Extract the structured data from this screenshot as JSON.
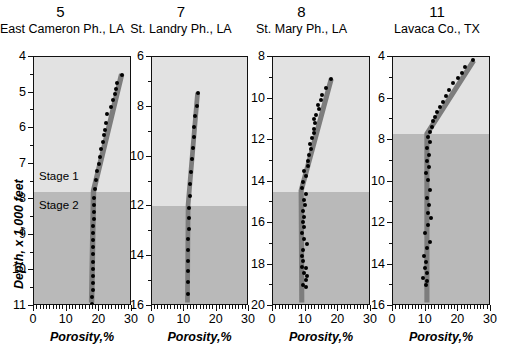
{
  "figure": {
    "yaxis_title": "Depth, x 1,000 feet",
    "xaxis_title": "Porosity,%",
    "stage_labels": {
      "stage1": "Stage 1",
      "stage2": "Stage 2"
    },
    "colors": {
      "stage1_fill": "#e2e2e2",
      "stage2_fill": "#b9b9b9",
      "trend_band": "#7d7d7d",
      "point": "#000000",
      "axis": "#111111"
    }
  },
  "chart_data": [
    {
      "type": "scatter",
      "panel_number": "5",
      "title": "East Cameron Ph., LA",
      "xlabel": "Porosity,%",
      "ylabel": "Depth, x 1,000 feet",
      "xlim": [
        0,
        30
      ],
      "ylim": [
        4,
        11
      ],
      "xticks": [
        0,
        10,
        20,
        30
      ],
      "yticks": [
        4,
        5,
        6,
        7,
        8,
        9,
        10,
        11
      ],
      "y_inverted": true,
      "grid": false,
      "stage_boundary_depth": 7.8,
      "stage1_label": "Stage 1",
      "stage2_label": "Stage 2",
      "trend_band": [
        {
          "porosity": 27.4,
          "depth": 4.45
        },
        {
          "porosity": 18.6,
          "depth": 7.8
        },
        {
          "porosity": 18.0,
          "depth": 11.0
        }
      ],
      "trend_band_width": 1.7,
      "points": [
        {
          "porosity": 26.9,
          "depth": 4.5
        },
        {
          "porosity": 25.4,
          "depth": 4.72
        },
        {
          "porosity": 25.2,
          "depth": 4.9
        },
        {
          "porosity": 24.7,
          "depth": 5.05
        },
        {
          "porosity": 24.1,
          "depth": 5.2
        },
        {
          "porosity": 23.6,
          "depth": 5.4
        },
        {
          "porosity": 22.4,
          "depth": 5.6
        },
        {
          "porosity": 22.0,
          "depth": 5.85
        },
        {
          "porosity": 21.8,
          "depth": 6.05
        },
        {
          "porosity": 21.3,
          "depth": 6.2
        },
        {
          "porosity": 21.0,
          "depth": 6.4
        },
        {
          "porosity": 20.6,
          "depth": 6.6
        },
        {
          "porosity": 20.2,
          "depth": 6.8
        },
        {
          "porosity": 19.8,
          "depth": 7.0
        },
        {
          "porosity": 19.4,
          "depth": 7.2
        },
        {
          "porosity": 19.1,
          "depth": 7.45
        },
        {
          "porosity": 18.8,
          "depth": 7.7
        },
        {
          "porosity": 18.5,
          "depth": 7.95
        },
        {
          "porosity": 18.4,
          "depth": 8.15
        },
        {
          "porosity": 18.3,
          "depth": 8.35
        },
        {
          "porosity": 18.3,
          "depth": 8.55
        },
        {
          "porosity": 18.2,
          "depth": 8.75
        },
        {
          "porosity": 18.2,
          "depth": 8.95
        },
        {
          "porosity": 18.2,
          "depth": 9.15
        },
        {
          "porosity": 18.1,
          "depth": 9.35
        },
        {
          "porosity": 18.1,
          "depth": 9.55
        },
        {
          "porosity": 18.1,
          "depth": 9.75
        },
        {
          "porosity": 18.0,
          "depth": 9.95
        },
        {
          "porosity": 18.0,
          "depth": 10.15
        },
        {
          "porosity": 18.0,
          "depth": 10.35
        },
        {
          "porosity": 18.0,
          "depth": 10.55
        },
        {
          "porosity": 17.9,
          "depth": 10.75
        },
        {
          "porosity": 17.9,
          "depth": 10.95
        }
      ]
    },
    {
      "type": "scatter",
      "panel_number": "7",
      "title": "St. Landry Ph., LA",
      "xlabel": "Porosity,%",
      "ylabel": "Depth, x 1,000 feet",
      "xlim": [
        0,
        30
      ],
      "ylim": [
        6,
        16
      ],
      "xticks": [
        0,
        10,
        20,
        30
      ],
      "yticks": [
        6,
        8,
        10,
        12,
        14,
        16
      ],
      "y_inverted": true,
      "grid": false,
      "stage_boundary_depth": 12.0,
      "trend_band": [
        {
          "porosity": 14.4,
          "depth": 7.4
        },
        {
          "porosity": 11.4,
          "depth": 12.0
        },
        {
          "porosity": 11.2,
          "depth": 16.0
        }
      ],
      "trend_band_width": 1.5,
      "points": [
        {
          "porosity": 14.2,
          "depth": 7.45
        },
        {
          "porosity": 13.8,
          "depth": 7.95
        },
        {
          "porosity": 13.4,
          "depth": 8.35
        },
        {
          "porosity": 13.1,
          "depth": 8.8
        },
        {
          "porosity": 12.9,
          "depth": 9.2
        },
        {
          "porosity": 12.6,
          "depth": 9.65
        },
        {
          "porosity": 12.3,
          "depth": 10.1
        },
        {
          "porosity": 12.1,
          "depth": 10.6
        },
        {
          "porosity": 11.9,
          "depth": 11.1
        },
        {
          "porosity": 11.6,
          "depth": 11.6
        },
        {
          "porosity": 11.4,
          "depth": 12.05
        },
        {
          "porosity": 11.3,
          "depth": 12.45
        },
        {
          "porosity": 11.3,
          "depth": 12.9
        },
        {
          "porosity": 11.2,
          "depth": 13.3
        },
        {
          "porosity": 11.2,
          "depth": 13.75
        },
        {
          "porosity": 11.2,
          "depth": 14.2
        },
        {
          "porosity": 11.1,
          "depth": 14.6
        },
        {
          "porosity": 11.1,
          "depth": 15.05
        },
        {
          "porosity": 11.0,
          "depth": 15.5
        }
      ]
    },
    {
      "type": "scatter",
      "panel_number": "8",
      "title": "St. Mary Ph., LA",
      "xlabel": "Porosity,%",
      "ylabel": "Depth, x 1,000 feet",
      "xlim": [
        0,
        30
      ],
      "ylim": [
        8,
        20
      ],
      "xticks": [
        0,
        10,
        20,
        30
      ],
      "yticks": [
        8,
        10,
        12,
        14,
        16,
        18,
        20
      ],
      "y_inverted": true,
      "grid": false,
      "stage_boundary_depth": 14.5,
      "trend_band": [
        {
          "porosity": 18.2,
          "depth": 9.0
        },
        {
          "porosity": 8.8,
          "depth": 14.5
        },
        {
          "porosity": 9.0,
          "depth": 20.0
        }
      ],
      "trend_band_width": 1.6,
      "points": [
        {
          "porosity": 17.8,
          "depth": 9.05
        },
        {
          "porosity": 16.3,
          "depth": 9.5
        },
        {
          "porosity": 15.0,
          "depth": 9.85
        },
        {
          "porosity": 14.8,
          "depth": 10.05
        },
        {
          "porosity": 13.9,
          "depth": 10.3
        },
        {
          "porosity": 14.2,
          "depth": 10.5
        },
        {
          "porosity": 13.3,
          "depth": 10.8
        },
        {
          "porosity": 12.7,
          "depth": 11.0
        },
        {
          "porosity": 13.0,
          "depth": 11.2
        },
        {
          "porosity": 12.4,
          "depth": 11.45
        },
        {
          "porosity": 12.6,
          "depth": 11.65
        },
        {
          "porosity": 11.9,
          "depth": 11.9
        },
        {
          "porosity": 11.4,
          "depth": 12.2
        },
        {
          "porosity": 11.7,
          "depth": 12.45
        },
        {
          "porosity": 11.0,
          "depth": 12.7
        },
        {
          "porosity": 10.6,
          "depth": 13.0
        },
        {
          "porosity": 10.8,
          "depth": 13.25
        },
        {
          "porosity": 9.6,
          "depth": 13.5
        },
        {
          "porosity": 10.1,
          "depth": 13.75
        },
        {
          "porosity": 9.2,
          "depth": 14.0
        },
        {
          "porosity": 8.9,
          "depth": 14.3
        },
        {
          "porosity": 10.2,
          "depth": 14.6
        },
        {
          "porosity": 9.4,
          "depth": 14.9
        },
        {
          "porosity": 9.8,
          "depth": 15.15
        },
        {
          "porosity": 9.1,
          "depth": 15.4
        },
        {
          "porosity": 9.5,
          "depth": 15.7
        },
        {
          "porosity": 9.2,
          "depth": 15.95
        },
        {
          "porosity": 9.6,
          "depth": 16.2
        },
        {
          "porosity": 9.0,
          "depth": 16.5
        },
        {
          "porosity": 9.4,
          "depth": 16.75
        },
        {
          "porosity": 10.3,
          "depth": 17.0
        },
        {
          "porosity": 9.2,
          "depth": 17.3
        },
        {
          "porosity": 8.9,
          "depth": 17.6
        },
        {
          "porosity": 9.3,
          "depth": 17.85
        },
        {
          "porosity": 8.8,
          "depth": 18.1
        },
        {
          "porosity": 10.2,
          "depth": 18.15
        },
        {
          "porosity": 9.6,
          "depth": 18.4
        },
        {
          "porosity": 10.4,
          "depth": 18.55
        },
        {
          "porosity": 10.0,
          "depth": 18.75
        },
        {
          "porosity": 9.1,
          "depth": 19.0
        },
        {
          "porosity": 10.1,
          "depth": 19.1
        }
      ]
    },
    {
      "type": "scatter",
      "panel_number": "11",
      "title": "Lavaca Co., TX",
      "xlabel": "Porosity,%",
      "ylabel": "Depth, x 1,000 feet",
      "xlim": [
        0,
        30
      ],
      "ylim": [
        4,
        16
      ],
      "xticks": [
        0,
        10,
        20,
        30
      ],
      "yticks": [
        4,
        6,
        8,
        10,
        12,
        14,
        16
      ],
      "y_inverted": true,
      "grid": false,
      "stage_boundary_depth": 7.7,
      "trend_band": [
        {
          "porosity": 25.2,
          "depth": 4.1
        },
        {
          "porosity": 10.6,
          "depth": 7.7
        },
        {
          "porosity": 10.6,
          "depth": 16.0
        }
      ],
      "trend_band_width": 1.6,
      "points": [
        {
          "porosity": 24.6,
          "depth": 4.15
        },
        {
          "porosity": 22.1,
          "depth": 4.5
        },
        {
          "porosity": 21.2,
          "depth": 4.75
        },
        {
          "porosity": 19.8,
          "depth": 5.0
        },
        {
          "porosity": 18.4,
          "depth": 5.25
        },
        {
          "porosity": 17.1,
          "depth": 5.6
        },
        {
          "porosity": 16.3,
          "depth": 5.9
        },
        {
          "porosity": 15.2,
          "depth": 6.15
        },
        {
          "porosity": 14.4,
          "depth": 6.4
        },
        {
          "porosity": 13.6,
          "depth": 6.65
        },
        {
          "porosity": 12.9,
          "depth": 6.9
        },
        {
          "porosity": 12.2,
          "depth": 7.1
        },
        {
          "porosity": 11.8,
          "depth": 7.35
        },
        {
          "porosity": 11.3,
          "depth": 7.6
        },
        {
          "porosity": 10.8,
          "depth": 7.85
        },
        {
          "porosity": 11.2,
          "depth": 8.1
        },
        {
          "porosity": 10.5,
          "depth": 8.4
        },
        {
          "porosity": 11.0,
          "depth": 8.7
        },
        {
          "porosity": 10.3,
          "depth": 9.0
        },
        {
          "porosity": 10.9,
          "depth": 9.3
        },
        {
          "porosity": 10.0,
          "depth": 9.6
        },
        {
          "porosity": 10.6,
          "depth": 9.95
        },
        {
          "porosity": 11.4,
          "depth": 10.4
        },
        {
          "porosity": 10.3,
          "depth": 10.8
        },
        {
          "porosity": 11.1,
          "depth": 11.15
        },
        {
          "porosity": 10.6,
          "depth": 11.5
        },
        {
          "porosity": 11.5,
          "depth": 11.75
        },
        {
          "porosity": 10.8,
          "depth": 12.1
        },
        {
          "porosity": 9.8,
          "depth": 12.5
        },
        {
          "porosity": 11.2,
          "depth": 12.9
        },
        {
          "porosity": 10.4,
          "depth": 13.2
        },
        {
          "porosity": 9.6,
          "depth": 13.6
        },
        {
          "porosity": 10.2,
          "depth": 13.9
        },
        {
          "porosity": 9.9,
          "depth": 14.15
        },
        {
          "porosity": 10.5,
          "depth": 14.4
        },
        {
          "porosity": 9.3,
          "depth": 14.65
        },
        {
          "porosity": 10.4,
          "depth": 14.8
        },
        {
          "porosity": 10.1,
          "depth": 15.0
        }
      ]
    }
  ]
}
